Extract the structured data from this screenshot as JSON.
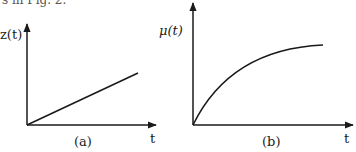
{
  "top_text": "s in Fig. 2.",
  "panels": [
    {
      "id": "a",
      "caption": "(a)",
      "y_label": "z(t)",
      "x_label": "t",
      "curve": "linear"
    },
    {
      "id": "b",
      "caption": "(b)",
      "y_label": "μ(t)",
      "x_label": "t",
      "curve": "saturating exponential"
    }
  ]
}
